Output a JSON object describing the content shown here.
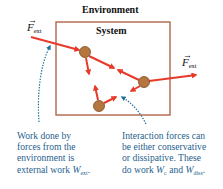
{
  "diagram": {
    "environment_label": "Environment",
    "system_label": "System",
    "force_label_left": {
      "symbol": "F",
      "subscript": "ext",
      "vector_mark": "→"
    },
    "force_label_right": {
      "symbol": "F",
      "subscript": "ext",
      "vector_mark": "→"
    },
    "caption_left": {
      "line1": "Work done by",
      "line2": "forces from the",
      "line3": "environment is",
      "line4_prefix": "external work ",
      "symbol": "W",
      "subscript": "ext",
      "suffix": "."
    },
    "caption_right": {
      "line1": "Interaction forces can",
      "line2": "be either conservative",
      "line3": "or dissipative. These",
      "line4_prefix": "do work ",
      "symbol1": "W",
      "sub1": "c",
      "mid": " and ",
      "symbol2": "W",
      "sub2": "diss",
      "suffix": "."
    },
    "colors": {
      "box": "#b0664a",
      "arrow": "#e8392a",
      "ball": "#b5773f",
      "ball_stroke": "#7a4a22",
      "dotted": "#1f6f9f",
      "caption_text": "#1f5f8f"
    },
    "particles": [
      {
        "name": "particle-1",
        "cx": 85,
        "cy": 52
      },
      {
        "name": "particle-2",
        "cx": 144,
        "cy": 82
      },
      {
        "name": "particle-3",
        "cx": 99,
        "cy": 106
      }
    ]
  }
}
